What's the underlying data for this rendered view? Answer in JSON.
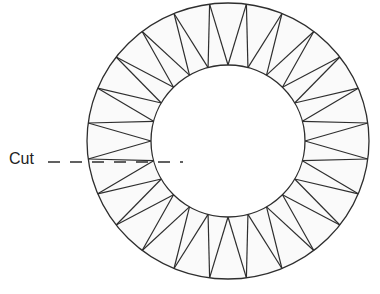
{
  "diagram": {
    "segments": 24,
    "cut_label": "Cut",
    "colors": {
      "stroke": "#2e2e2e",
      "ring_fill": "#fafafa",
      "background": "#ffffff"
    }
  }
}
